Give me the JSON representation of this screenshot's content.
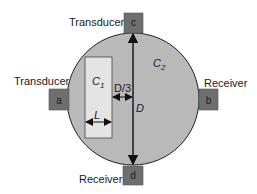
{
  "diagram": {
    "colors": {
      "circle_fill": "#b9b9b9",
      "circle_stroke": "#222222",
      "box_fill": "#6e6e6e",
      "inner_rect_fill": "#e4e4e4",
      "line": "#111111",
      "background": "#ffffff"
    },
    "outer_medium": {
      "symbol": "C",
      "subscript": "2"
    },
    "inner_medium": {
      "symbol": "C",
      "subscript": "1",
      "width_label": "L"
    },
    "diameter_label": "D",
    "offset_label": "D/3",
    "nodes": [
      {
        "id": "a",
        "letter": "a",
        "role": "Transducer",
        "position": "left"
      },
      {
        "id": "b",
        "letter": "b",
        "role": "Receiver",
        "position": "right"
      },
      {
        "id": "c",
        "letter": "c",
        "role": "Transducer",
        "position": "top"
      },
      {
        "id": "d",
        "letter": "d",
        "role": "Receiver",
        "position": "bottom"
      }
    ]
  }
}
